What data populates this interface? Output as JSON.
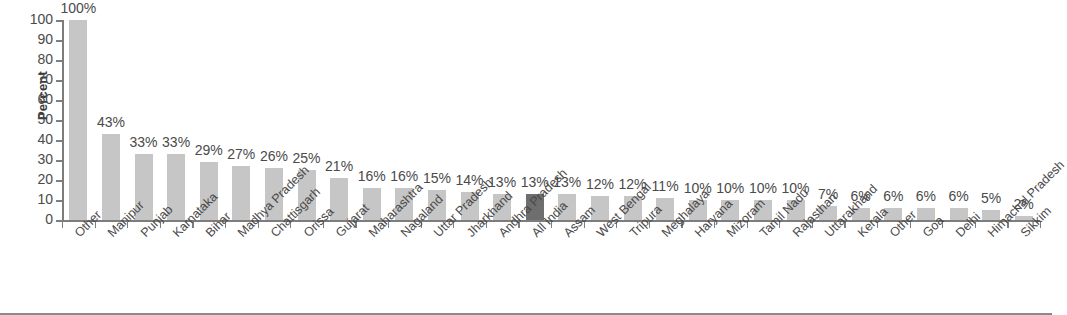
{
  "chart_data": {
    "type": "bar",
    "title": "",
    "xlabel": "",
    "ylabel": "Percent",
    "ylim": [
      0,
      100
    ],
    "ytick_labels": [
      "0",
      "10",
      "20",
      "30",
      "40",
      "50",
      "60",
      "70",
      "80",
      "90",
      "100"
    ],
    "yticks": [
      0,
      10,
      20,
      30,
      40,
      50,
      60,
      70,
      80,
      90,
      100
    ],
    "grid": false,
    "legend": null,
    "bar_color": "#c6c6c6",
    "highlight_color": "#6e6e6e",
    "highlight_category": "All India",
    "categories": [
      "Other",
      "Manipur",
      "Punjab",
      "Karnataka",
      "Bihar",
      "Madhya Pradesh",
      "Chattisgarh",
      "Orissa",
      "Gujarat",
      "Maharashtra",
      "Nagaland",
      "Uttar Pradesh",
      "Jharkhand",
      "Andhra Pradesh",
      "All India",
      "Assam",
      "West Bengal",
      "Tripura",
      "Meghalaya",
      "Haryana",
      "Mizoram",
      "Tamil Nadu",
      "Rajasthan",
      "Uttarakhand",
      "Kerala",
      "Other",
      "Goa",
      "Delhi",
      "Himachal Pradesh",
      "Sikkim"
    ],
    "values": [
      100,
      43,
      33,
      33,
      29,
      27,
      26,
      25,
      21,
      16,
      16,
      15,
      14,
      13,
      13,
      13,
      12,
      12,
      11,
      10,
      10,
      10,
      10,
      7,
      6,
      6,
      6,
      6,
      5,
      2
    ],
    "data_labels": [
      "100%",
      "43%",
      "33%",
      "33%",
      "29%",
      "27%",
      "26%",
      "25%",
      "21%",
      "16%",
      "16%",
      "15%",
      "14%",
      "13%",
      "13%",
      "13%",
      "12%",
      "12%",
      "11%",
      "10%",
      "10%",
      "10%",
      "10%",
      "7%",
      "6%",
      "6%",
      "6%",
      "6%",
      "5%",
      "2%"
    ]
  }
}
